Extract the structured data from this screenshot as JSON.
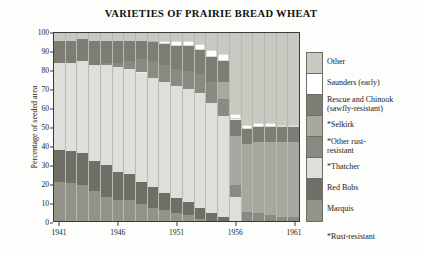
{
  "chart_data": {
    "type": "bar",
    "title": "VARIETIES OF PRAIRIE BREAD WHEAT",
    "xlabel": "",
    "ylabel": "Percentage of seeded area",
    "ylim": [
      0,
      100
    ],
    "yticks": [
      0,
      10,
      20,
      30,
      40,
      50,
      60,
      70,
      80,
      90,
      100
    ],
    "grid": false,
    "stacked": true,
    "stack_total": 100,
    "legend_position": "right",
    "footnote": "*Rust-resistant",
    "x": [
      1941,
      1942,
      1943,
      1944,
      1945,
      1946,
      1947,
      1948,
      1949,
      1950,
      1951,
      1952,
      1953,
      1954,
      1955,
      1956,
      1957,
      1958,
      1959,
      1960,
      1961
    ],
    "xtick_labels": [
      "1941",
      "1946",
      "1951",
      "1956",
      "1961"
    ],
    "xtick_years": [
      1941,
      1946,
      1951,
      1956,
      1961
    ],
    "series": [
      {
        "name": "Marquis",
        "color": "#939389",
        "values": [
          21,
          20,
          19,
          16,
          13,
          11,
          11,
          9,
          7,
          6,
          4,
          3,
          1,
          0,
          0,
          0,
          0,
          0,
          0,
          0,
          0
        ]
      },
      {
        "name": "Red Bobs",
        "color": "#6f6f68",
        "values": [
          17,
          17,
          17,
          16,
          17,
          15,
          14,
          12,
          11,
          9,
          8,
          7,
          6,
          4,
          2,
          0,
          0,
          0,
          0,
          0,
          0
        ]
      },
      {
        "name": "*Thatcher",
        "color": "#dededa",
        "values": [
          46,
          47,
          49,
          51,
          53,
          56,
          56,
          58,
          58,
          59,
          60,
          60,
          61,
          59,
          54,
          13,
          0,
          0,
          0,
          0,
          0
        ]
      },
      {
        "name": "*Other rust-resistant",
        "color": "#8a8a82",
        "values": [
          0,
          0,
          0,
          0,
          1,
          2,
          4,
          7,
          9,
          9,
          9,
          10,
          10,
          11,
          9,
          6,
          5,
          4,
          3,
          2,
          2
        ]
      },
      {
        "name": "*Selkirk",
        "color": "#a8a8a0",
        "values": [
          0,
          0,
          0,
          0,
          0,
          0,
          0,
          0,
          0,
          0,
          0,
          0,
          0,
          0,
          9,
          26,
          36,
          38,
          39,
          40,
          40
        ]
      },
      {
        "name": "Rescue and Chinook (sawfly-resistant)",
        "color": "#7d7d76",
        "values": [
          12,
          12,
          12,
          13,
          12,
          12,
          11,
          10,
          10,
          11,
          12,
          13,
          13,
          13,
          11,
          9,
          8,
          8,
          8,
          8,
          8
        ]
      },
      {
        "name": "Saunders (early)",
        "color": "#ffffff",
        "values": [
          0,
          0,
          0,
          0,
          0,
          0,
          0,
          0,
          1,
          2,
          3,
          3,
          3,
          4,
          4,
          3,
          2,
          2,
          2,
          1,
          1
        ]
      },
      {
        "name": "Other",
        "color": "#c9c9c2",
        "values": [
          4,
          4,
          3,
          4,
          4,
          4,
          4,
          4,
          4,
          4,
          4,
          4,
          6,
          9,
          11,
          43,
          49,
          48,
          48,
          49,
          49
        ]
      }
    ]
  },
  "legend": {
    "entries": [
      {
        "label": "Other",
        "label2": "",
        "color": "#c9c9c2"
      },
      {
        "label": "Saunders (early)",
        "label2": "",
        "color": "#ffffff"
      },
      {
        "label": "Rescue and Chinook",
        "label2": "(sawfly-resistant)",
        "color": "#7d7d76"
      },
      {
        "label": "*Selkirk",
        "label2": "",
        "color": "#a8a8a0"
      },
      {
        "label": "*Other rust-",
        "label2": "resistant",
        "color": "#8a8a82"
      },
      {
        "label": "*Thatcher",
        "label2": "",
        "color": "#dededa"
      },
      {
        "label": "Red Bobs",
        "label2": "",
        "color": "#6f6f68"
      },
      {
        "label": "Marquis",
        "label2": "",
        "color": "#939389"
      }
    ],
    "note": "*Rust-resistant"
  }
}
